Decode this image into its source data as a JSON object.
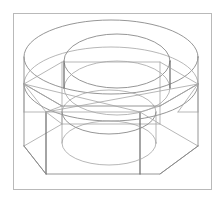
{
  "figure": {
    "render_style": "wireframe line drawing, no hidden line removal",
    "projection": "isometric / axonometric",
    "background_color": "#ffffff",
    "line_color": "#8a8a8a",
    "line_color_strong": "#6e6e6e",
    "line_color_faint": "#a5a5a5",
    "frame_color": "#b9b9b9",
    "canvas_width": "222",
    "canvas_height": "202"
  },
  "frame": {
    "x": "13",
    "y": "13",
    "width": "199",
    "height": "177",
    "stroke_width": "1"
  },
  "geometry": {
    "top_cylinder": {
      "label": "upper cylindrical collar",
      "top_ellipse": {
        "cx": "111",
        "cy": "57",
        "rx": "87",
        "ry": "37"
      },
      "bottom_ellipse": {
        "cx": "111",
        "cy": "84",
        "rx": "87",
        "ry": "37"
      },
      "left_silhouette_x": "24",
      "right_silhouette_x": "198",
      "height": "27"
    },
    "bore": {
      "label": "central cylindrical through hole",
      "top_ellipse": {
        "cx": "117",
        "cy": "61",
        "rx": "53",
        "ry": "27"
      },
      "mid_ellipse": {
        "cx": "117",
        "cy": "88",
        "rx": "53",
        "ry": "27"
      },
      "bottom_ellipse": {
        "cx": "109",
        "cy": "143",
        "rx": "47",
        "ry": "22"
      },
      "left_silhouette_x": "64",
      "right_silhouette_x": "170"
    },
    "hexagon_top": {
      "label": "top face of hex prism",
      "vertices": [
        {
          "name": "left",
          "x": "24",
          "y": "84"
        },
        {
          "name": "upper-left",
          "x": "62",
          "y": "62"
        },
        {
          "name": "upper-right",
          "x": "160",
          "y": "62"
        },
        {
          "name": "right",
          "x": "198",
          "y": "84"
        },
        {
          "name": "lower-right",
          "x": "160",
          "y": "106"
        },
        {
          "name": "lower-left",
          "x": "62",
          "y": "106"
        }
      ]
    },
    "hexagon_bottom": {
      "label": "bottom face of hex prism",
      "vertices": [
        {
          "name": "left",
          "x": "24",
          "y": "146"
        },
        {
          "name": "upper-left",
          "x": "62",
          "y": "124"
        },
        {
          "name": "upper-right",
          "x": "160",
          "y": "124"
        },
        {
          "name": "right",
          "x": "198",
          "y": "146"
        },
        {
          "name": "lower-right",
          "x": "160",
          "y": "174"
        },
        {
          "name": "lower-left",
          "x": "46",
          "y": "174"
        }
      ]
    },
    "vertical_edges": {
      "label": "hex prism side edges",
      "count": "6",
      "x_positions": [
        "24",
        "46",
        "62",
        "140",
        "160",
        "198"
      ]
    },
    "chamfer_lines": {
      "label": "corner chamfer / construction lines at hexagon corners",
      "count": "8"
    }
  },
  "annotations": {
    "has_text_labels": "false",
    "has_dimensions": "false",
    "has_axes": "false"
  }
}
